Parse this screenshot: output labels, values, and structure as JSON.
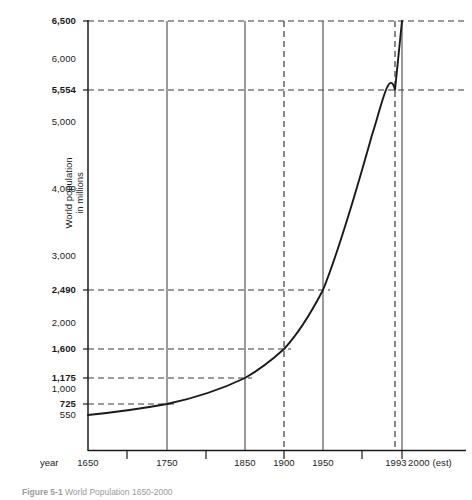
{
  "chart_data": {
    "type": "line",
    "title": "World Population 1650-2000",
    "xlabel": "year",
    "ylabel": "World population in millions",
    "grid": true,
    "legend": false,
    "xlim": [
      1650,
      2010
    ],
    "ylim": [
      550,
      6500
    ],
    "x_tick_labels": [
      "1650",
      "1750",
      "1850",
      "1900",
      "1950",
      "1993",
      "2000 (est)"
    ],
    "x_minor_ticks": [
      1700,
      1800,
      1900,
      1950,
      1993
    ],
    "y_tick_labels": [
      "6,500",
      "6,000",
      "5,554",
      "5,000",
      "4,000",
      "3,000",
      "2,490",
      "2,000",
      "1,600",
      "1,175",
      "1,000",
      "725",
      "550"
    ],
    "y_emphasized_labels": [
      "5,554",
      "2,490",
      "1,600",
      "1,175",
      "725"
    ],
    "x": [
      1650,
      1750,
      1850,
      1900,
      1950,
      1993,
      2000
    ],
    "values": [
      550,
      725,
      1175,
      1600,
      2490,
      5554,
      6500
    ],
    "data_points": [
      {
        "year": "1650",
        "population": 550
      },
      {
        "year": "1750",
        "population": 725
      },
      {
        "year": "1850",
        "population": 1175
      },
      {
        "year": "1900",
        "population": 1600
      },
      {
        "year": "1950",
        "population": 2490
      },
      {
        "year": "1993",
        "population": 5554
      },
      {
        "year": "2000 (est)",
        "population": 6500
      }
    ],
    "annotations": [
      "Dashed horizontal guide lines mark 6,500 / 5,554 / 2,490 / 1,600 / 1,175 / 725",
      "Dashed vertical guide lines mark 1900 and 1993",
      "Solid vertical grid lines mark 1750, 1850, 1950 and 2000"
    ],
    "colors": {
      "line": "#1a1a1a",
      "grid": "#555555",
      "axis": "#1a1a1a",
      "background": "#ffffff"
    }
  },
  "axes": {
    "y_ticks": [
      {
        "label": "6,500",
        "value": 6500,
        "bold": true,
        "y": 21
      },
      {
        "label": "6,000",
        "value": 6000,
        "bold": false,
        "y": 59
      },
      {
        "label": "5,554",
        "value": 5554,
        "bold": true,
        "y": 90
      },
      {
        "label": "5,000",
        "value": 5000,
        "bold": false,
        "y": 122
      },
      {
        "label": "4,000",
        "value": 4000,
        "bold": false,
        "y": 189
      },
      {
        "label": "3,000",
        "value": 3000,
        "bold": false,
        "y": 256
      },
      {
        "label": "2,490",
        "value": 2490,
        "bold": true,
        "y": 290
      },
      {
        "label": "2,000",
        "value": 2000,
        "bold": false,
        "y": 323
      },
      {
        "label": "1,600",
        "value": 1600,
        "bold": true,
        "y": 349
      },
      {
        "label": "1,175",
        "value": 1175,
        "bold": true,
        "y": 378
      },
      {
        "label": "1,000",
        "value": 1000,
        "bold": false,
        "y": 389
      },
      {
        "label": "725",
        "value": 725,
        "bold": true,
        "y": 404
      },
      {
        "label": "550",
        "value": 550,
        "bold": false,
        "y": 415
      }
    ],
    "x_ticks": [
      {
        "label": "1650",
        "x": 88
      },
      {
        "label": "1750",
        "x": 167
      },
      {
        "label": "1850",
        "x": 245
      },
      {
        "label": "1900",
        "x": 284
      },
      {
        "label": "1950",
        "x": 323
      },
      {
        "label": "1993",
        "x": 396
      },
      {
        "label": "2000 (est)",
        "x": 430
      }
    ],
    "x_name": "year"
  },
  "caption": {
    "label": "Figure 5-1",
    "text": "World Population 1650-2000"
  }
}
